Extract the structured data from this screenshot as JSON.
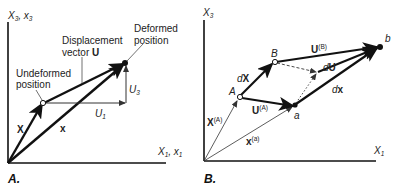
{
  "panel_a": {
    "label": "A.",
    "axis_y": {
      "main": "X",
      "sub": "3",
      "sep": ", ",
      "main2": "x",
      "sub2": "3"
    },
    "axis_x": {
      "main": "X",
      "sub": "1",
      "sep": ", ",
      "main2": "x",
      "sub2": "1"
    },
    "annotations": {
      "displacement_line1": "Displacement",
      "displacement_line2": "vector ",
      "displacement_bold": "U",
      "deformed_line1": "Deformed",
      "deformed_line2": "position",
      "undeformed_line1": "Undeformed",
      "undeformed_line2": "position"
    },
    "vectors": {
      "X": "X",
      "x": "x",
      "U1": {
        "main": "U",
        "sub": "1"
      },
      "U3": {
        "main": "U",
        "sub": "3"
      }
    }
  },
  "panel_b": {
    "label": "B.",
    "axis_y": {
      "main": "X",
      "sub": "3"
    },
    "axis_x": {
      "main": "X",
      "sub": "1"
    },
    "points": {
      "A": "A",
      "B": "B",
      "a": "a",
      "b": "b"
    },
    "vectors": {
      "UB": {
        "main": "U",
        "sup": "(B)"
      },
      "UA": {
        "main": "U",
        "sup": "(A)"
      },
      "dU": {
        "d": "d",
        "main": "U"
      },
      "dX": {
        "d": "d",
        "main": "X"
      },
      "dx": {
        "d": "d",
        "main": "x"
      },
      "XA": {
        "main": "X",
        "sup": "(A)"
      },
      "xa": {
        "main": "x",
        "sup": "(a)"
      }
    }
  }
}
